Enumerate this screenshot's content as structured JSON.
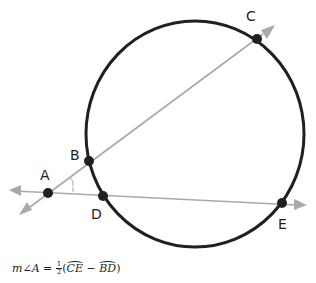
{
  "diagram": {
    "colors": {
      "circle": "#231f20",
      "points": "#231f20",
      "lines": "#a7a9ac",
      "arrows": "#a7a9ac",
      "text": "#231f20"
    },
    "circle": {
      "cx": 195,
      "cy": 134,
      "r": 112
    },
    "points": [
      {
        "name": "A",
        "x": 48,
        "y": 193,
        "label_x": 40,
        "label_y": 168
      },
      {
        "name": "B",
        "x": 89,
        "y": 161,
        "label_x": 70,
        "label_y": 148
      },
      {
        "name": "C",
        "x": 257,
        "y": 39,
        "label_x": 246,
        "label_y": 9
      },
      {
        "name": "D",
        "x": 103,
        "y": 196,
        "label_x": 91,
        "label_y": 207
      },
      {
        "name": "E",
        "x": 282,
        "y": 203,
        "label_x": 278,
        "label_y": 217
      }
    ],
    "labels": {
      "A": "A",
      "B": "B",
      "C": "C",
      "D": "D",
      "E": "E"
    },
    "secants": [
      {
        "name": "secant-ABC",
        "through": [
          "A",
          "B",
          "C"
        ]
      },
      {
        "name": "secant-ADE",
        "through": [
          "A",
          "D",
          "E"
        ]
      }
    ],
    "formula": {
      "lhs": "m∠A",
      "equals": "=",
      "frac_num": "1",
      "frac_den": "2",
      "open": "(",
      "arc1": "CE",
      "minus": "−",
      "arc2": "BD",
      "close": ")",
      "text": "m∠A = 1/2(arc CE − arc BD)"
    }
  }
}
